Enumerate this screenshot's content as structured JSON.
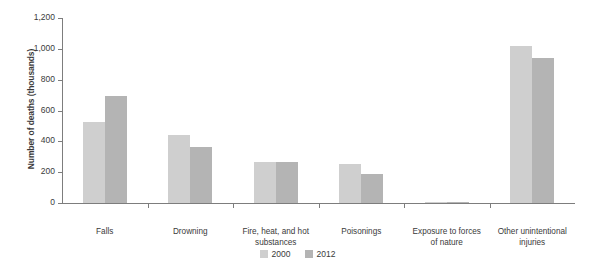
{
  "chart_data": {
    "type": "bar",
    "title": "",
    "xlabel": "",
    "ylabel": "Number of deaths (thousands)",
    "ylim": [
      0,
      1200
    ],
    "ytick_labels": [
      "0",
      "200",
      "400",
      "600",
      "800",
      "1,000",
      "1,200"
    ],
    "ytick_values": [
      0,
      200,
      400,
      600,
      800,
      1000,
      1200
    ],
    "grid": false,
    "legend_position": "bottom-center",
    "categories": [
      "Falls",
      "Drowning",
      "Fire, heat, and hot substances",
      "Poisonings",
      "Exposure to forces of nature",
      "Other unintentional injuries"
    ],
    "category_lines": [
      [
        "Falls"
      ],
      [
        "Drowning"
      ],
      [
        "Fire, heat, and hot",
        "substances"
      ],
      [
        "Poisonings"
      ],
      [
        "Exposure to forces",
        "of nature"
      ],
      [
        "Other unintentional",
        "injuries"
      ]
    ],
    "series": [
      {
        "name": "2000",
        "color": "#cfcfcf",
        "values": [
          527,
          442,
          266,
          253,
          5,
          1020
        ]
      },
      {
        "name": "2012",
        "color": "#b4b4b4",
        "values": [
          693,
          364,
          266,
          188,
          4,
          940
        ]
      }
    ]
  },
  "legend": {
    "items": [
      {
        "label": "2000",
        "color": "#cfcfcf"
      },
      {
        "label": "2012",
        "color": "#b4b4b4"
      }
    ]
  }
}
